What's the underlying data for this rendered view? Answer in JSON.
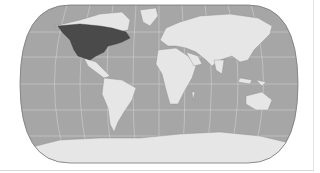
{
  "map": {
    "projection": "world-pseudocylindrical",
    "highlighted_region": "North America",
    "colors": {
      "ocean": "#a6a6a6",
      "land": "#e6e6e6",
      "highlight": "#4a4a4a",
      "graticule": "#d4d4d4",
      "outline": "#777777"
    }
  }
}
